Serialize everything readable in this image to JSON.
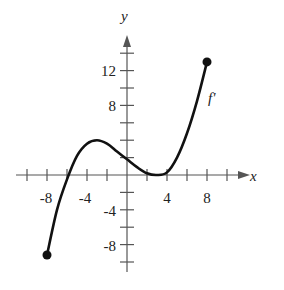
{
  "chart_data": {
    "type": "line",
    "title": "",
    "xlabel": "x",
    "ylabel": "y",
    "curve_label": "f'",
    "xlim": [
      -10,
      10
    ],
    "ylim": [
      -10,
      14
    ],
    "x_ticks": [
      -10,
      -8,
      -6,
      -4,
      -2,
      0,
      2,
      4,
      6,
      8,
      10
    ],
    "y_ticks": [
      -10,
      -8,
      -6,
      -4,
      -2,
      0,
      2,
      4,
      6,
      8,
      10,
      12,
      14
    ],
    "x_tick_labels": [
      "-8",
      "-4",
      "4",
      "8"
    ],
    "y_tick_labels": [
      "12",
      "8",
      "-4",
      "-8"
    ],
    "grid": false,
    "legend": "none",
    "series": [
      {
        "name": "f'",
        "x": [
          -8,
          -7,
          -6,
          -5,
          -4,
          -3,
          -2,
          -1,
          0,
          1,
          2,
          3,
          4,
          5,
          6,
          7,
          8
        ],
        "values": [
          -9.2,
          -4.0,
          -0.5,
          2.2,
          3.6,
          4.0,
          3.6,
          2.7,
          1.8,
          0.9,
          0.2,
          0,
          0.3,
          2.0,
          4.8,
          8.5,
          13.0
        ]
      }
    ],
    "endpoints": [
      {
        "x": -8,
        "y": -9.2,
        "style": "closed-dot"
      },
      {
        "x": 8,
        "y": 13,
        "style": "closed-dot"
      }
    ]
  }
}
